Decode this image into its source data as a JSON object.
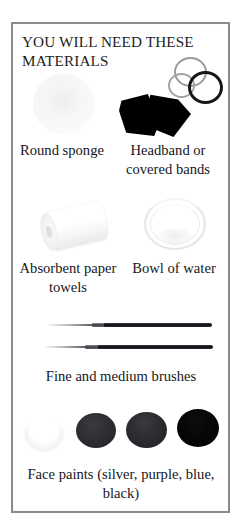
{
  "page": {
    "title": "YOU WILL NEED THESE MATERIALS",
    "border_color": "#8b8b8e",
    "background_color": "#ffffff",
    "text_color": "#17171a"
  },
  "items": [
    {
      "id": "round-sponge",
      "caption": "Round sponge",
      "image_name": "round-sponge-photo",
      "color": "#f4f4f5"
    },
    {
      "id": "headband",
      "caption": "Headband or covered bands",
      "image_name": "headband-and-bands-photo",
      "color": "#000000"
    },
    {
      "id": "paper-towels",
      "caption": "Absorbent paper towels",
      "image_name": "paper-towel-roll-photo",
      "color": "#ffffff"
    },
    {
      "id": "bowl-of-water",
      "caption": "Bowl of water",
      "image_name": "bowl-of-water-photo",
      "color": "#e6e6e9"
    },
    {
      "id": "brushes",
      "caption": "Fine and medium brushes",
      "image_name": "paint-brushes-photo",
      "color": "#101014"
    },
    {
      "id": "face-paints",
      "caption": "Face paints (silver, purple, blue, black)",
      "image_name": "face-paint-pots-photo",
      "color": "#000000"
    }
  ],
  "paint_pots": [
    {
      "name": "silver",
      "swatch": "#ffffff"
    },
    {
      "name": "purple",
      "swatch": "#2c2c30"
    },
    {
      "name": "blue",
      "swatch": "#2a2a2e"
    },
    {
      "name": "black",
      "swatch": "#000000"
    }
  ]
}
